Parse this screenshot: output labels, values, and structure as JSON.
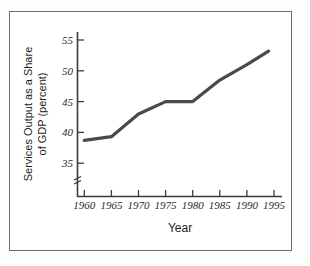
{
  "chart_data": {
    "type": "line",
    "title": "",
    "xlabel": "Year",
    "ylabel": "Services Output as a Share of GDP (percent)",
    "ylabel_line1": "Services Output as a Share",
    "ylabel_line2": "of GDP (percent)",
    "x": [
      1960,
      1965,
      1970,
      1975,
      1980,
      1985,
      1990,
      1994
    ],
    "values": [
      38.7,
      39.3,
      43.0,
      45.0,
      45.0,
      48.5,
      51.0,
      53.2
    ],
    "series": [
      {
        "name": "Services Output as a Share of GDP",
        "values": [
          38.7,
          39.3,
          43.0,
          45.0,
          45.0,
          48.5,
          51.0,
          53.2
        ]
      }
    ],
    "xticks": [
      1960,
      1965,
      1970,
      1975,
      1980,
      1985,
      1990,
      1995
    ],
    "xtick_labels": [
      "1960",
      "1965",
      "1970",
      "1975",
      "1980",
      "1985",
      "1990",
      "1995"
    ],
    "yticks": [
      35,
      40,
      45,
      50,
      55
    ],
    "ytick_labels": [
      "35",
      "40",
      "45",
      "50",
      "55"
    ],
    "xlim": [
      1958.5,
      1996.5
    ],
    "ylim": [
      35,
      56
    ],
    "grid": false,
    "legend": false,
    "legend_position": "none",
    "axis_break": true,
    "axis_break_axis": "y",
    "line_color": "#4a4a4a",
    "axis_color": "#3b3b3b",
    "background_color": "#ffffff",
    "frame_color": "#6d6d6d"
  },
  "figure": {
    "axis_break_symbol": "axis-break-icon"
  }
}
